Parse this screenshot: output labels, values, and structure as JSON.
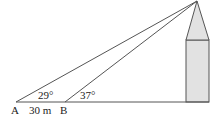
{
  "diagram": {
    "points": {
      "A": "A",
      "B": "B"
    },
    "distance_label": "30 m",
    "angle_at_A": "29°",
    "angle_at_B": "37°",
    "colors": {
      "line": "#555555",
      "tower_fill": "#e2e2e2"
    }
  }
}
